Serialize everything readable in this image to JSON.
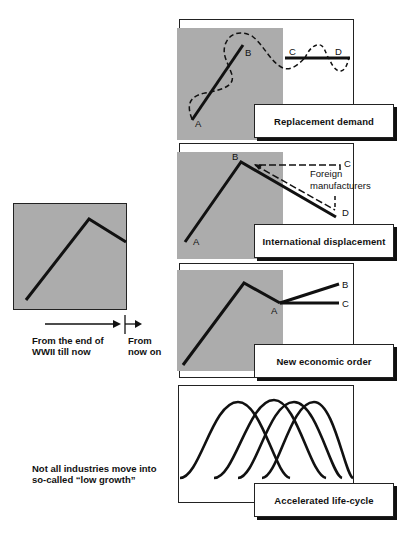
{
  "left_panel": {
    "timeline": {
      "past_label_line1": "From the end of",
      "past_label_line2": "WWII till now",
      "future_label_line1": "From",
      "future_label_line2": "now on"
    },
    "note_line1": "Not all industries move into",
    "note_line2": "so-called “low growth”"
  },
  "scenarios": [
    {
      "title": "Replacement demand",
      "points": {
        "a": "A",
        "b": "B",
        "c": "C",
        "d": "D"
      }
    },
    {
      "title": "International displacement",
      "points": {
        "a": "A",
        "b": "B",
        "c": "C",
        "d": "D"
      },
      "annotation_line1": "Foreign",
      "annotation_line2": "manufacturers"
    },
    {
      "title": "New economic order",
      "points": {
        "a": "A",
        "b": "B",
        "c": "C"
      }
    },
    {
      "title": "Accelerated life-cycle",
      "curve_count": 4
    }
  ],
  "colors": {
    "line": "#111111",
    "shade": "#c9c9c9",
    "background": "#ffffff"
  }
}
